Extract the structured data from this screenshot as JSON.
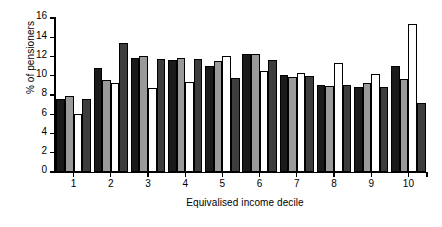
{
  "chart_data": {
    "type": "bar",
    "title": "",
    "subtitle": "",
    "xlabel": "Equivalised income decile",
    "ylabel": "% of pensioners",
    "categories": [
      "1",
      "2",
      "3",
      "4",
      "5",
      "6",
      "7",
      "8",
      "9",
      "10"
    ],
    "ylim": [
      0,
      16
    ],
    "ytick_labels": [
      "0",
      "2",
      "4",
      "6",
      "8",
      "10",
      "12",
      "14",
      "16"
    ],
    "ytick_values": [
      0,
      2,
      4,
      6,
      8,
      10,
      12,
      14,
      16
    ],
    "grid": false,
    "legend": "none",
    "series": [
      {
        "name": "series-1",
        "color": "#1a1a1a",
        "values": [
          7.6,
          10.8,
          11.8,
          11.6,
          11.0,
          12.3,
          10.1,
          9.0,
          8.8,
          11.0
        ]
      },
      {
        "name": "series-2",
        "color": "#9a9a9a",
        "values": [
          7.9,
          9.6,
          12.1,
          11.8,
          11.5,
          12.3,
          9.9,
          8.9,
          9.3,
          9.7
        ]
      },
      {
        "name": "series-3",
        "color": "#ffffff",
        "values": [
          6.0,
          9.3,
          8.7,
          9.4,
          12.1,
          10.5,
          10.3,
          11.3,
          10.2,
          15.4
        ]
      },
      {
        "name": "series-4",
        "color": "#3d3d3d",
        "values": [
          7.6,
          13.4,
          11.7,
          11.7,
          9.8,
          11.6,
          10.0,
          9.0,
          8.8,
          7.2
        ]
      }
    ]
  }
}
